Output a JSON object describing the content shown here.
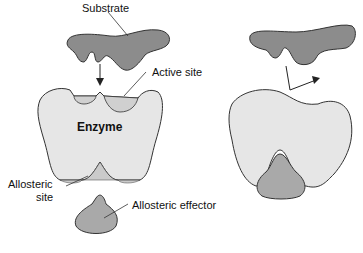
{
  "diagram": {
    "labels": {
      "substrate": "Substrate",
      "active_site": "Active site",
      "enzyme": "Enzyme",
      "allosteric_site_line1": "Allosteric",
      "allosteric_site_line2": "site",
      "allosteric_effector": "Allosteric effector"
    },
    "colors": {
      "substrate": "#8c8c8c",
      "enzyme": "#e6e6e6",
      "effector": "#a9a9a9",
      "outline": "#333333"
    }
  }
}
